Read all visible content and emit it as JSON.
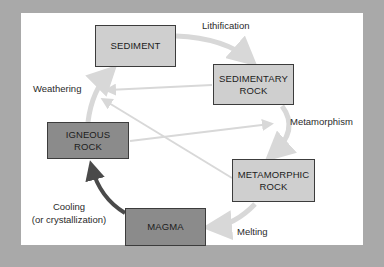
{
  "diagram": {
    "colors": {
      "background": "#a9a9a9",
      "panel": "#ffffff",
      "light_box": "#cfcfcf",
      "dark_box": "#8b8b8b",
      "cycle_arrow": "#d8d8d8",
      "cooling_arrow": "#4a4a4a"
    },
    "nodes": {
      "sediment": "SEDIMENT",
      "sedimentary_rock": {
        "line1": "SEDIMENTARY",
        "line2": "ROCK"
      },
      "igneous_rock": {
        "line1": "IGNEOUS",
        "line2": "ROCK"
      },
      "metamorphic_rock": {
        "line1": "METAMORPHIC",
        "line2": "ROCK"
      },
      "magma": "MAGMA"
    },
    "processes": {
      "lithification": "Lithification",
      "weathering": "Weathering",
      "metamorphism": "Metamorphism",
      "melting": "Melting",
      "cooling_line1": "Cooling",
      "cooling_line2": "(or crystallization)"
    }
  }
}
